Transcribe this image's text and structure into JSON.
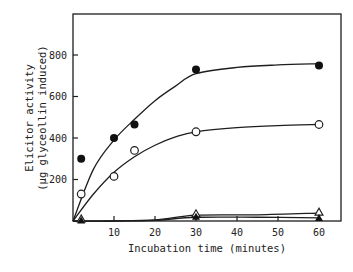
{
  "chart_data": {
    "type": "scatter",
    "title": "",
    "xlabel": "Incubation time (minutes)",
    "ylabel_line1": "Elicitor activity",
    "ylabel_line2": "(µg glyceollin induced)",
    "xlim": [
      0,
      65
    ],
    "ylim": [
      0,
      980
    ],
    "xticks": [
      10,
      20,
      30,
      40,
      50,
      60
    ],
    "yticks": [
      200,
      400,
      600,
      800
    ],
    "grid": false,
    "legend": "none",
    "series": [
      {
        "name": "filled circles",
        "marker": "filled-circle",
        "x": [
          2,
          10,
          15,
          30,
          60
        ],
        "y": [
          300,
          400,
          465,
          730,
          750
        ],
        "curve": [
          [
            0,
            0
          ],
          [
            5,
            250
          ],
          [
            10,
            390
          ],
          [
            15,
            490
          ],
          [
            20,
            580
          ],
          [
            25,
            650
          ],
          [
            30,
            710
          ],
          [
            40,
            740
          ],
          [
            50,
            752
          ],
          [
            60,
            758
          ]
        ]
      },
      {
        "name": "open circles",
        "marker": "open-circle",
        "x": [
          2,
          10,
          15,
          30,
          60
        ],
        "y": [
          130,
          215,
          340,
          430,
          465
        ],
        "curve": [
          [
            0,
            0
          ],
          [
            5,
            130
          ],
          [
            10,
            235
          ],
          [
            15,
            310
          ],
          [
            20,
            365
          ],
          [
            25,
            405
          ],
          [
            30,
            430
          ],
          [
            40,
            450
          ],
          [
            50,
            460
          ],
          [
            60,
            465
          ]
        ]
      },
      {
        "name": "open triangles",
        "marker": "open-triangle",
        "x": [
          2,
          30,
          60
        ],
        "y": [
          5,
          30,
          38
        ],
        "curve": [
          [
            0,
            0
          ],
          [
            10,
            0
          ],
          [
            20,
            5
          ],
          [
            30,
            28
          ],
          [
            45,
            30
          ],
          [
            60,
            38
          ]
        ]
      },
      {
        "name": "filled triangles",
        "marker": "filled-triangle",
        "x": [
          2,
          30,
          60
        ],
        "y": [
          3,
          20,
          15
        ],
        "curve": [
          [
            0,
            0
          ],
          [
            10,
            0
          ],
          [
            20,
            3
          ],
          [
            30,
            18
          ],
          [
            45,
            18
          ],
          [
            60,
            15
          ]
        ]
      }
    ]
  },
  "labels": {
    "xlabel": "Incubation time (minutes)",
    "ylabel_line1": "Elicitor activity",
    "ylabel_line2": "(µg glyceollin induced)"
  }
}
